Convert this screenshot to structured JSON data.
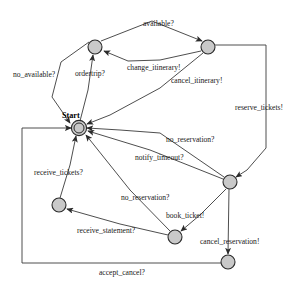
{
  "diagram": {
    "type": "state-machine",
    "title": "",
    "canvas": {
      "width": 304,
      "height": 287,
      "background": "#ffffff"
    },
    "node_style": {
      "fill": "#c9c9c9",
      "stroke": "#2b2b2b",
      "radius": 7
    },
    "edge_style": {
      "stroke": "#3a3a3a",
      "width": 0.9
    },
    "start_state_label": "Start",
    "nodes": [
      {
        "id": "start",
        "label": "Start",
        "cx": 79,
        "cy": 128,
        "r": 7,
        "initial": true
      },
      {
        "id": "n_top_left",
        "label": "",
        "cx": 95,
        "cy": 47,
        "r": 7,
        "initial": false
      },
      {
        "id": "n_top_right",
        "label": "",
        "cx": 208,
        "cy": 47,
        "r": 7,
        "initial": false
      },
      {
        "id": "n_mid_right",
        "label": "",
        "cx": 230,
        "cy": 182,
        "r": 7,
        "initial": false
      },
      {
        "id": "n_left_low",
        "label": "",
        "cx": 59,
        "cy": 205,
        "r": 7,
        "initial": false
      },
      {
        "id": "n_bottom_mid",
        "label": "",
        "cx": 175,
        "cy": 237,
        "r": 7,
        "initial": false
      },
      {
        "id": "n_bottom_right",
        "label": "",
        "cx": 228,
        "cy": 262,
        "r": 7,
        "initial": false
      }
    ],
    "transitions": [
      {
        "id": "t1",
        "label": "available?",
        "from": "n_top_left",
        "to": "n_top_right",
        "label_x": 143,
        "label_y": 26
      },
      {
        "id": "t2",
        "label": "no_available?",
        "from": "n_top_left",
        "to": "start",
        "label_x": 13,
        "label_y": 77
      },
      {
        "id": "t3",
        "label": "ordertrip?",
        "from": "start",
        "to": "n_top_left",
        "label_x": 75,
        "label_y": 76
      },
      {
        "id": "t4",
        "label": "change_itinerary!",
        "from": "n_top_right",
        "to": "n_top_left",
        "label_x": 127,
        "label_y": 70
      },
      {
        "id": "t5",
        "label": "cancel_itinerary!",
        "from": "n_top_right",
        "to": "start",
        "label_x": 171,
        "label_y": 83
      },
      {
        "id": "t6",
        "label": "reserve_tickets!",
        "from": "n_top_right",
        "to": "n_mid_right",
        "label_x": 235,
        "label_y": 110
      },
      {
        "id": "t7",
        "label": "no_reservation?",
        "from": "n_mid_right",
        "to": "start",
        "label_x": 166,
        "label_y": 142
      },
      {
        "id": "t8",
        "label": "notify_timeout?",
        "from": "n_mid_right",
        "to": "start",
        "label_x": 135,
        "label_y": 160
      },
      {
        "id": "t9",
        "label": "receive_tickets?",
        "from": "n_left_low",
        "to": "start",
        "label_x": 34,
        "label_y": 175
      },
      {
        "id": "t10",
        "label": "no_reservation?",
        "from": "n_bottom_mid",
        "to": "start",
        "label_x": 121,
        "label_y": 200
      },
      {
        "id": "t11",
        "label": "book_ticket!",
        "from": "n_mid_right",
        "to": "n_bottom_mid",
        "label_x": 166,
        "label_y": 218
      },
      {
        "id": "t12",
        "label": "receive_statement?",
        "from": "n_bottom_mid",
        "to": "n_left_low",
        "label_x": 77,
        "label_y": 233
      },
      {
        "id": "t13",
        "label": "cancel_reservation!",
        "from": "n_mid_right",
        "to": "n_bottom_right",
        "label_x": 200,
        "label_y": 244
      },
      {
        "id": "t14",
        "label": "accept_cancel?",
        "from": "n_bottom_right",
        "to": "start",
        "label_x": 99,
        "label_y": 275
      }
    ]
  }
}
